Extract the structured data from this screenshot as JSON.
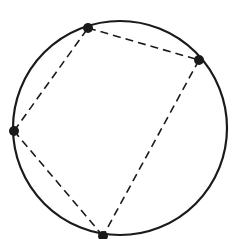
{
  "diagram": {
    "type": "cyclic-quadrilateral",
    "background": "#ffffff",
    "stroke_color": "#1a1a1a",
    "circle": {
      "cx": 120,
      "cy": 128,
      "r": 107
    },
    "points": [
      {
        "id": "top",
        "x": 88,
        "y": 28
      },
      {
        "id": "right",
        "x": 199,
        "y": 60
      },
      {
        "id": "bottom",
        "x": 103,
        "y": 236
      },
      {
        "id": "left",
        "x": 14,
        "y": 131
      }
    ],
    "edges": [
      {
        "from": 0,
        "to": 1,
        "style": "dashed"
      },
      {
        "from": 1,
        "to": 2,
        "style": "dashed"
      },
      {
        "from": 2,
        "to": 3,
        "style": "dashed"
      },
      {
        "from": 3,
        "to": 0,
        "style": "dashed"
      }
    ]
  }
}
